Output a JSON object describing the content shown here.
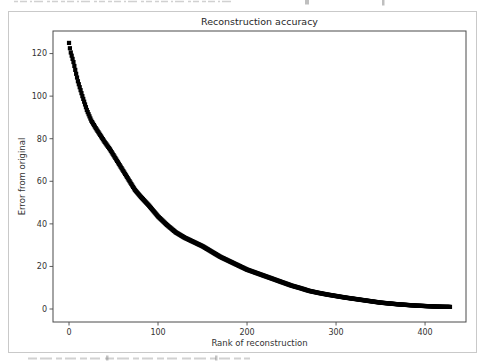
{
  "figure": {
    "background": "#ffffff",
    "border_color": "#c9c9c9",
    "spine_color": "#4a4a4a",
    "tick_color": "#4a4a4a",
    "text_color": "#333333",
    "title_color": "#262626",
    "axes_px": {
      "left": 53,
      "top": 31,
      "right": 466,
      "bottom": 322
    },
    "border_px": {
      "left": 8.5,
      "top": 11.5,
      "right": 476.5,
      "bottom": 352.5
    }
  },
  "chart_data": {
    "type": "scatter",
    "title": "Reconstruction accuracy",
    "xlabel": "Rank of reconstruction",
    "ylabel": "Error from original",
    "marker": "square",
    "marker_color": "#000000",
    "marker_size_px": 4.2,
    "grid": false,
    "legend": null,
    "xticks": [
      0,
      100,
      200,
      300,
      400
    ],
    "yticks": [
      0,
      20,
      40,
      60,
      80,
      100,
      120
    ],
    "xlim": [
      -18,
      446
    ],
    "ylim": [
      -6.1,
      130.6
    ],
    "x_range": [
      0,
      428
    ],
    "n_points": 429,
    "series": [
      {
        "name": "reconstruction-error",
        "x": [
          0,
          1,
          2,
          3,
          5,
          8,
          10,
          15,
          20,
          25,
          30,
          40,
          46,
          50,
          60,
          70,
          74,
          80,
          90,
          100,
          110,
          120,
          130,
          140,
          150,
          160,
          170,
          180,
          190,
          200,
          210,
          220,
          230,
          240,
          250,
          260,
          270,
          280,
          290,
          300,
          310,
          320,
          330,
          340,
          350,
          360,
          370,
          380,
          390,
          400,
          410,
          420,
          428
        ],
        "y": [
          125,
          122.5,
          120.5,
          119,
          116,
          110.5,
          107,
          100,
          93.5,
          88.5,
          85,
          78.5,
          75,
          72.3,
          65.5,
          58.7,
          56,
          53,
          48.5,
          43.5,
          39.5,
          36,
          33.5,
          31.5,
          29.5,
          27,
          24.5,
          22.5,
          20.5,
          18.5,
          17,
          15.5,
          14,
          12.5,
          11,
          9.8,
          8.5,
          7.6,
          6.8,
          6.1,
          5.4,
          4.8,
          4.2,
          3.6,
          3,
          2.6,
          2.2,
          1.9,
          1.6,
          1.4,
          1.2,
          1.05,
          1
        ]
      }
    ]
  }
}
